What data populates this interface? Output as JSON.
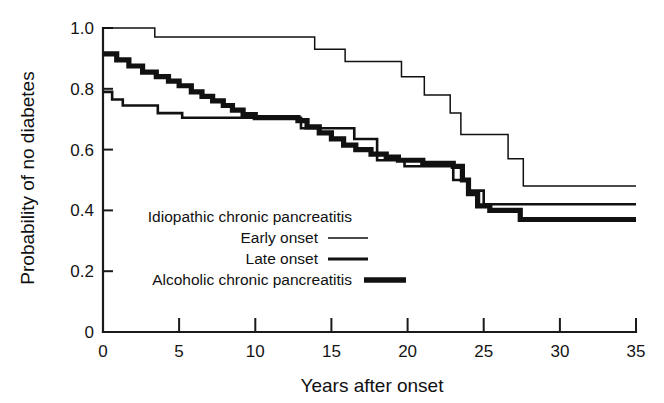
{
  "chart_data": {
    "type": "line",
    "title": "",
    "subtitle": "",
    "xlabel": "Years after onset",
    "ylabel": "Probability of no diabetes",
    "xlim": [
      0,
      35
    ],
    "ylim": [
      0,
      1.0
    ],
    "grid": false,
    "legend_position": "inside-lower-left",
    "xticks": [
      0,
      5,
      10,
      15,
      20,
      25,
      30,
      35
    ],
    "xtick_labels": [
      "0",
      "5",
      "10",
      "15",
      "20",
      "25",
      "30",
      "35"
    ],
    "yticks": [
      0,
      0.2,
      0.4,
      0.6,
      0.8,
      1.0
    ],
    "ytick_labels": [
      "0",
      "0.2",
      "0.4",
      "0.6",
      "0.8",
      "1.0"
    ],
    "step_style": "post",
    "series": [
      {
        "name": "Early onset",
        "group": "Idiopathic chronic pancreatitis",
        "style": "thin",
        "color": "#111111",
        "final_value": 0.48,
        "points": [
          [
            0.0,
            1.0
          ],
          [
            3.4,
            1.0
          ],
          [
            3.4,
            0.97
          ],
          [
            13.9,
            0.97
          ],
          [
            13.9,
            0.93
          ],
          [
            15.9,
            0.93
          ],
          [
            15.9,
            0.89
          ],
          [
            19.6,
            0.89
          ],
          [
            19.6,
            0.84
          ],
          [
            21.1,
            0.84
          ],
          [
            21.1,
            0.78
          ],
          [
            22.8,
            0.78
          ],
          [
            22.8,
            0.72
          ],
          [
            23.5,
            0.72
          ],
          [
            23.5,
            0.65
          ],
          [
            26.6,
            0.65
          ],
          [
            26.6,
            0.57
          ],
          [
            27.6,
            0.57
          ],
          [
            27.6,
            0.48
          ],
          [
            35.0,
            0.48
          ]
        ]
      },
      {
        "name": "Late onset",
        "group": "Idiopathic chronic pancreatitis",
        "style": "medium",
        "color": "#111111",
        "final_value": 0.42,
        "points": [
          [
            0.0,
            0.79
          ],
          [
            0.6,
            0.79
          ],
          [
            0.6,
            0.765
          ],
          [
            1.3,
            0.765
          ],
          [
            1.3,
            0.745
          ],
          [
            3.6,
            0.745
          ],
          [
            3.6,
            0.72
          ],
          [
            5.2,
            0.72
          ],
          [
            5.2,
            0.705
          ],
          [
            13.0,
            0.705
          ],
          [
            13.0,
            0.67
          ],
          [
            16.5,
            0.67
          ],
          [
            16.5,
            0.635
          ],
          [
            18.0,
            0.635
          ],
          [
            18.0,
            0.565
          ],
          [
            19.8,
            0.565
          ],
          [
            19.8,
            0.545
          ],
          [
            23.0,
            0.545
          ],
          [
            23.0,
            0.5
          ],
          [
            24.0,
            0.5
          ],
          [
            24.0,
            0.465
          ],
          [
            25.0,
            0.465
          ],
          [
            25.0,
            0.42
          ],
          [
            35.0,
            0.42
          ]
        ]
      },
      {
        "name": "Alcoholic chronic pancreatitis",
        "group": "Alcoholic chronic pancreatitis",
        "style": "thick",
        "color": "#111111",
        "final_value": 0.37,
        "points": [
          [
            0.0,
            0.915
          ],
          [
            0.9,
            0.915
          ],
          [
            0.9,
            0.895
          ],
          [
            1.7,
            0.895
          ],
          [
            1.7,
            0.875
          ],
          [
            2.6,
            0.875
          ],
          [
            2.6,
            0.855
          ],
          [
            3.5,
            0.855
          ],
          [
            3.5,
            0.84
          ],
          [
            4.3,
            0.84
          ],
          [
            4.3,
            0.825
          ],
          [
            5.0,
            0.825
          ],
          [
            5.0,
            0.81
          ],
          [
            5.8,
            0.81
          ],
          [
            5.8,
            0.79
          ],
          [
            6.5,
            0.79
          ],
          [
            6.5,
            0.775
          ],
          [
            7.2,
            0.775
          ],
          [
            7.2,
            0.76
          ],
          [
            7.9,
            0.76
          ],
          [
            7.9,
            0.745
          ],
          [
            8.5,
            0.745
          ],
          [
            8.5,
            0.73
          ],
          [
            9.2,
            0.73
          ],
          [
            9.2,
            0.715
          ],
          [
            10.0,
            0.715
          ],
          [
            10.0,
            0.705
          ],
          [
            12.8,
            0.705
          ],
          [
            12.8,
            0.695
          ],
          [
            13.4,
            0.695
          ],
          [
            13.4,
            0.675
          ],
          [
            14.2,
            0.675
          ],
          [
            14.2,
            0.655
          ],
          [
            15.0,
            0.655
          ],
          [
            15.0,
            0.635
          ],
          [
            15.8,
            0.635
          ],
          [
            15.8,
            0.615
          ],
          [
            16.6,
            0.615
          ],
          [
            16.6,
            0.6
          ],
          [
            17.6,
            0.6
          ],
          [
            17.6,
            0.585
          ],
          [
            18.6,
            0.585
          ],
          [
            18.6,
            0.575
          ],
          [
            19.4,
            0.575
          ],
          [
            19.4,
            0.565
          ],
          [
            21.0,
            0.565
          ],
          [
            21.0,
            0.555
          ],
          [
            23.0,
            0.555
          ],
          [
            23.0,
            0.545
          ],
          [
            23.6,
            0.545
          ],
          [
            23.6,
            0.5
          ],
          [
            24.0,
            0.5
          ],
          [
            24.0,
            0.455
          ],
          [
            24.6,
            0.455
          ],
          [
            24.6,
            0.415
          ],
          [
            25.4,
            0.415
          ],
          [
            25.4,
            0.4
          ],
          [
            27.4,
            0.4
          ],
          [
            27.4,
            0.37
          ],
          [
            35.0,
            0.37
          ]
        ]
      }
    ],
    "legend": {
      "entries": [
        {
          "label": "Idiopathic chronic pancreatitis",
          "sample": "none"
        },
        {
          "label": "Early onset",
          "sample": "thin"
        },
        {
          "label": "Late onset",
          "sample": "medium"
        },
        {
          "label": "Alcoholic chronic pancreatitis",
          "sample": "thick"
        }
      ]
    }
  },
  "axes": {
    "x_title": "Years after onset",
    "y_title": "Probability of no diabetes",
    "x_tick_labels": [
      "0",
      "5",
      "10",
      "15",
      "20",
      "25",
      "30",
      "35"
    ],
    "y_tick_labels": [
      "1.0",
      "0.8",
      "0.6",
      "0.4",
      "0.2",
      "0"
    ]
  },
  "legend": {
    "line1": "Idiopathic chronic pancreatitis",
    "line2": "Early onset",
    "line3": "Late onset",
    "line4": "Alcoholic chronic pancreatitis"
  },
  "colors": {
    "ink": "#111111",
    "background": "#ffffff"
  }
}
